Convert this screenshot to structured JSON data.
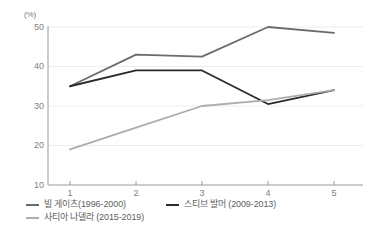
{
  "chart_data": {
    "type": "line",
    "title": "",
    "xlabel": "",
    "ylabel": "",
    "unit_label": "(%)",
    "categories": [
      "1",
      "2",
      "3",
      "4",
      "5"
    ],
    "x": [
      1,
      2,
      3,
      4,
      5
    ],
    "ylim": [
      10,
      50
    ],
    "xlim": [
      0.62,
      5.38
    ],
    "yticks": [
      50,
      40,
      30,
      20,
      10
    ],
    "ytick_labels": [
      "50",
      "40",
      "30",
      "20",
      "10"
    ],
    "xticks": [
      1,
      2,
      3,
      4,
      5
    ],
    "xtick_labels": [
      "1",
      "2",
      "3",
      "4",
      "5"
    ],
    "grid": true,
    "grid_axis": "y",
    "legend_position": "bottom-left",
    "series": [
      {
        "name": "빌 게이츠(1996-2000)",
        "color": "#6b6b6b",
        "values": [
          35,
          43,
          42.5,
          50,
          48.5
        ]
      },
      {
        "name": "스티브 발머 (2009-2013)",
        "color": "#2b2b2b",
        "values": [
          35,
          39,
          39,
          30.5,
          34
        ]
      },
      {
        "name": "사티아 나델라 (2015-2019)",
        "color": "#adadad",
        "values": [
          19,
          24.5,
          30,
          31.5,
          34
        ]
      }
    ]
  },
  "axis": {
    "unit": "(%)",
    "y_labels": [
      "50",
      "40",
      "30",
      "20",
      "10"
    ],
    "x_labels": [
      "1",
      "2",
      "3",
      "4",
      "5"
    ]
  },
  "legend": {
    "items": [
      {
        "label": "빌 게이츠(1996-2000)",
        "color": "#6b6b6b"
      },
      {
        "label": "스티브 발머 (2009-2013)",
        "color": "#2b2b2b"
      },
      {
        "label": "사티아 나델라 (2015-2019)",
        "color": "#adadad"
      }
    ]
  },
  "colors": {
    "axis_line": "#9a9a9a",
    "grid_line": "#ededed",
    "tick_text": "#808080",
    "legend_text": "#5e5e5e",
    "background": "#ffffff"
  }
}
